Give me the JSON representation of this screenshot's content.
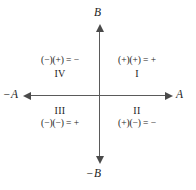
{
  "diagram": {
    "axes": {
      "vertical_positive_label": "B",
      "vertical_negative_label": "−B",
      "horizontal_positive_label": "A",
      "horizontal_negative_label": "−A",
      "line_color": "#5a5a5a",
      "arrow_color": "#4a4a4a"
    },
    "quadrants": [
      {
        "position": "top-left",
        "numeral": "IV",
        "expression": "(−)(+) = −",
        "sign_result": "−"
      },
      {
        "position": "top-right",
        "numeral": "I",
        "expression": "(+)(+) = +",
        "sign_result": "+"
      },
      {
        "position": "bottom-left",
        "numeral": "III",
        "expression": "(−)(−) = +",
        "sign_result": "+"
      },
      {
        "position": "bottom-right",
        "numeral": "II",
        "expression": "(+)(−) = −",
        "sign_result": "−"
      }
    ]
  }
}
